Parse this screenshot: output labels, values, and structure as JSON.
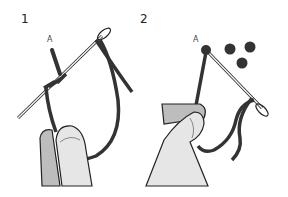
{
  "figure": {
    "panels": [
      {
        "step": "1",
        "point_label": "A",
        "description": "Needle wrapped with thread twice near point A, held between fingers"
      },
      {
        "step": "2",
        "point_label": "A",
        "description": "Thread pulled through forming a knot at point A; three finished knots shown"
      }
    ],
    "colors": {
      "thread": "#333333",
      "skin": "#e6e6e6",
      "skin_shadow": "#bdbdbd",
      "outline": "#222222",
      "needle": "#f4f4f4"
    }
  }
}
